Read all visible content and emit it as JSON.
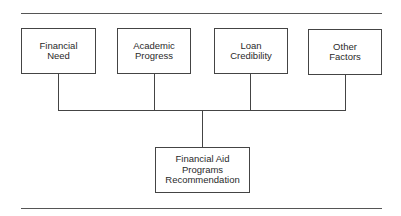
{
  "diagram": {
    "type": "tree",
    "direction": "bottom-up-merge",
    "inputs": [
      {
        "id": "financial-need",
        "lines": [
          "Financial",
          "Need"
        ]
      },
      {
        "id": "academic-progress",
        "lines": [
          "Academic",
          "Progress"
        ]
      },
      {
        "id": "loan-credibility",
        "lines": [
          "Loan",
          "Credibility"
        ]
      },
      {
        "id": "other-factors",
        "lines": [
          "Other",
          "Factors"
        ]
      }
    ],
    "output": {
      "id": "financial-aid-programs-recommendation",
      "lines": [
        "Financial Aid",
        "Programs",
        "Recommendation"
      ]
    },
    "edges": [
      [
        "financial-need",
        "financial-aid-programs-recommendation"
      ],
      [
        "academic-progress",
        "financial-aid-programs-recommendation"
      ],
      [
        "loan-credibility",
        "financial-aid-programs-recommendation"
      ],
      [
        "other-factors",
        "financial-aid-programs-recommendation"
      ]
    ],
    "colors": {
      "line": "#444444",
      "text": "#2a2a2a",
      "background": "#ffffff"
    }
  }
}
